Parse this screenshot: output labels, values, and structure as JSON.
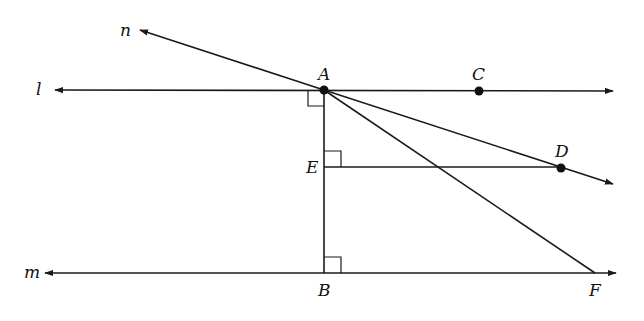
{
  "diagram": {
    "type": "geometry",
    "lines": {
      "l": {
        "label": "l",
        "description": "horizontal line through A and C"
      },
      "m": {
        "label": "m",
        "description": "horizontal line through B and F, parallel to l"
      },
      "n": {
        "label": "n",
        "description": "ray from A extending up-left"
      }
    },
    "points": {
      "A": {
        "label": "A",
        "x": 324,
        "y": 90
      },
      "B": {
        "label": "B",
        "x": 324,
        "y": 273
      },
      "C": {
        "label": "C",
        "x": 479,
        "y": 91
      },
      "D": {
        "label": "D",
        "x": 561,
        "y": 168
      },
      "E": {
        "label": "E",
        "x": 324,
        "y": 167
      },
      "F": {
        "label": "F",
        "x": 595,
        "y": 273
      }
    },
    "segments": [
      "AB",
      "ED",
      "AF",
      "AD ray"
    ],
    "right_angles": [
      "at A between l and AB",
      "at E between AB and ED",
      "at B between AB and m"
    ],
    "colors": {
      "stroke": "#1a1a1a",
      "background": "#ffffff"
    }
  }
}
